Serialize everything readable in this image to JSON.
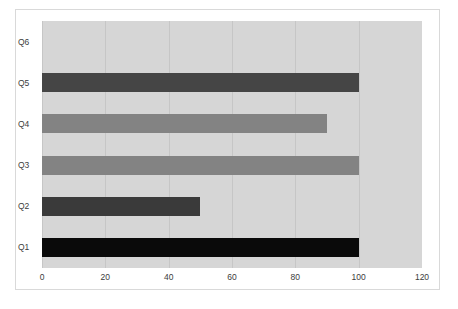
{
  "figure": {
    "caption": "",
    "background": "#ffffff",
    "border_color": "#d9d9d9"
  },
  "chart_data": {
    "type": "bar",
    "orientation": "horizontal",
    "title": "",
    "xlabel": "",
    "ylabel": "",
    "categories": [
      "Q1",
      "Q2",
      "Q3",
      "Q4",
      "Q5",
      "Q6"
    ],
    "values": [
      100,
      50,
      100,
      90,
      100,
      0
    ],
    "bar_colors": [
      "#0a0a0a",
      "#3a3a3a",
      "#838383",
      "#838383",
      "#454545",
      "#d6d6d6"
    ],
    "xlim": [
      0,
      120
    ],
    "xticks": [
      0,
      20,
      40,
      60,
      80,
      100,
      120
    ],
    "xtick_labels": [
      "0",
      "20",
      "40",
      "60",
      "80",
      "100",
      "120"
    ],
    "grid": true,
    "grid_axis": "x",
    "grid_color": "#c6c6c6",
    "plot_background": "#d6d6d6",
    "legend": false,
    "legend_position": "none",
    "series": [
      {
        "name": "Series 1",
        "points": [
          {
            "category": "Q1",
            "value": 100,
            "color": "#0a0a0a"
          },
          {
            "category": "Q2",
            "value": 50,
            "color": "#3a3a3a"
          },
          {
            "category": "Q3",
            "value": 100,
            "color": "#838383"
          },
          {
            "category": "Q4",
            "value": 90,
            "color": "#838383"
          },
          {
            "category": "Q5",
            "value": 100,
            "color": "#454545"
          },
          {
            "category": "Q6",
            "value": 0,
            "color": "#d6d6d6"
          }
        ]
      }
    ]
  }
}
